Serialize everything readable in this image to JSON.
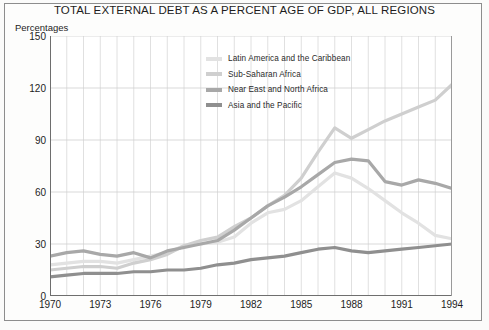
{
  "chart_data": {
    "type": "line",
    "title": "TOTAL EXTERNAL DEBT AS A PERCENT AGE OF GDP, ALL REGIONS",
    "ylabel": "Percentages",
    "xlabel": "",
    "ylim": [
      0,
      150
    ],
    "yticks": [
      0,
      30,
      60,
      90,
      120,
      150
    ],
    "xlim": [
      1970,
      1994
    ],
    "xticks": [
      1970,
      1973,
      1976,
      1979,
      1982,
      1985,
      1988,
      1991,
      1994
    ],
    "grid": true,
    "grid_x_step": 1,
    "legend_position": "upper-center",
    "x": [
      1970,
      1971,
      1972,
      1973,
      1974,
      1975,
      1976,
      1977,
      1978,
      1979,
      1980,
      1981,
      1982,
      1983,
      1984,
      1985,
      1986,
      1987,
      1988,
      1989,
      1990,
      1991,
      1992,
      1993,
      1994
    ],
    "series": [
      {
        "name": "Latin America and the Caribbean",
        "color": "#e2e2e2",
        "values": [
          18,
          19,
          20,
          20,
          19,
          21,
          23,
          25,
          29,
          30,
          31,
          34,
          42,
          48,
          50,
          55,
          63,
          71,
          68,
          62,
          55,
          48,
          42,
          35,
          33
        ]
      },
      {
        "name": "Sub-Saharan Africa",
        "color": "#cfcfcf",
        "values": [
          15,
          16,
          17,
          17,
          16,
          19,
          21,
          24,
          29,
          32,
          34,
          40,
          45,
          52,
          58,
          68,
          83,
          97,
          91,
          96,
          101,
          105,
          109,
          113,
          122
        ]
      },
      {
        "name": "Near East and North Africa",
        "color": "#a8a8a8",
        "values": [
          23,
          25,
          26,
          24,
          23,
          25,
          22,
          26,
          28,
          30,
          32,
          38,
          45,
          52,
          57,
          63,
          70,
          77,
          79,
          78,
          66,
          64,
          67,
          65,
          62
        ]
      },
      {
        "name": "Asia and the Pacific",
        "color": "#8f8f8f",
        "values": [
          11,
          12,
          13,
          13,
          13,
          14,
          14,
          15,
          15,
          16,
          18,
          19,
          21,
          22,
          23,
          25,
          27,
          28,
          26,
          25,
          26,
          27,
          28,
          29,
          30
        ]
      }
    ]
  },
  "legend": {
    "items": [
      {
        "label": "Latin America and the Caribbean",
        "color": "#e2e2e2"
      },
      {
        "label": "Sub-Saharan Africa",
        "color": "#cfcfcf"
      },
      {
        "label": "Near East and North Africa",
        "color": "#a8a8a8"
      },
      {
        "label": "Asia and the Pacific",
        "color": "#8f8f8f"
      }
    ]
  }
}
